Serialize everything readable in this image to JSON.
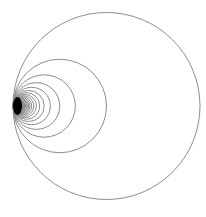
{
  "diagram": {
    "title": "",
    "background": "#ffffff",
    "stroke_color": "#808080",
    "core_color": "#000000",
    "tangent_point": {
      "x": 13,
      "y": 106
    },
    "largest_diameter": 187,
    "circle_count": 60,
    "stroke_width": 0.9
  }
}
